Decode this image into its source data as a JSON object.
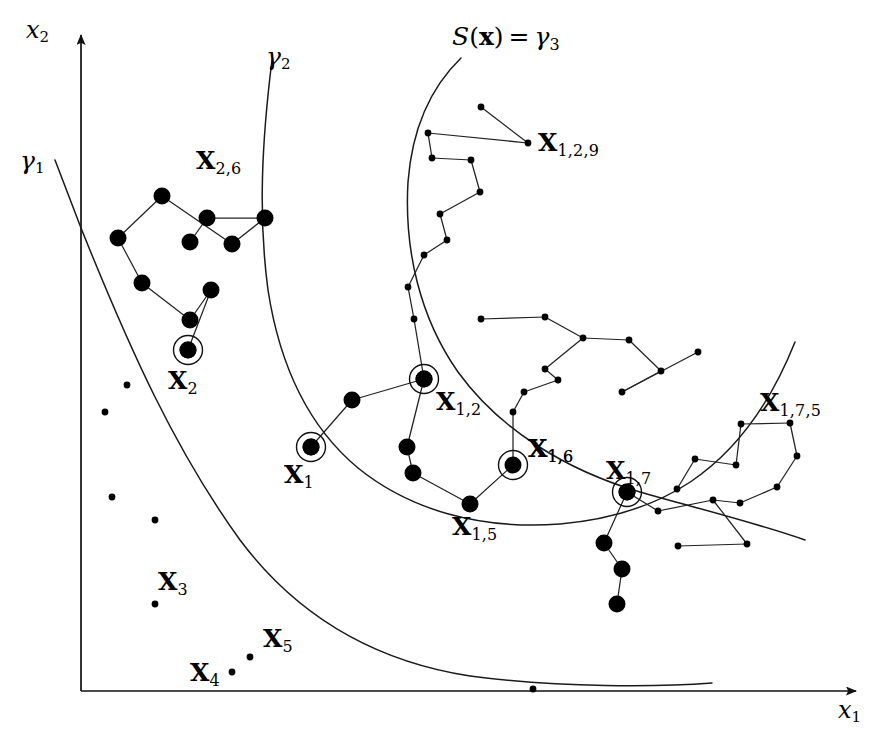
{
  "figure": {
    "kind": "scatter-tree-level-set-diagram",
    "background_color": "#ffffff",
    "ink_color": "#000000",
    "width": 891,
    "height": 746
  },
  "axes": {
    "x_label": "x",
    "x_label_sub": "1",
    "y_label": "x",
    "y_label_sub": "2",
    "x_axis": {
      "x1": 81,
      "y1": 691,
      "x2": 856,
      "y2": 691
    },
    "y_axis": {
      "x1": 81,
      "y1": 691,
      "x2": 81,
      "y2": 35
    }
  },
  "curves": [
    {
      "id": "gamma1",
      "label_base": "γ",
      "label_sub": "1",
      "label_x": 20,
      "label_y": 148,
      "path": "M 55 160 L 81 228 C 130 350 175 450 240 540 C 300 620 380 662 470 676 C 560 688 660 687 712 683"
    },
    {
      "id": "gamma2",
      "label_base": "γ",
      "label_sub": "2",
      "label_x": 266,
      "label_y": 44,
      "path": "M 272 60 C 262 140 258 215 268 290 C 280 368 310 428 358 468 C 410 510 480 530 560 524 C 650 516 740 480 795 342"
    },
    {
      "id": "gamma3",
      "label_sfunc": "S",
      "label_paren_open": "(",
      "label_bf_x": "x",
      "label_paren_close": ")",
      "label_eq": "=",
      "label_gamma": "γ",
      "label_sub": "3",
      "label_x": 452,
      "label_y": 24,
      "path": "M 461 58 C 430 88 412 130 408 182 C 404 250 420 318 458 372 C 500 430 566 470 640 492 C 700 509 760 524 805 540"
    }
  ],
  "curve_notes": {
    "gamma2_tail": "M 795 342 C 760 352 700 366 640 392",
    "gamma2_tail_enabled": false
  },
  "clusters": [
    {
      "id": "cluster-x26",
      "label": "X",
      "label_sub": "2,6",
      "label_x": 196,
      "label_y": 148,
      "marker": "large",
      "nodes": [
        [
          118,
          238
        ],
        [
          142,
          283
        ],
        [
          162,
          196
        ],
        [
          190,
          242
        ],
        [
          207,
          218
        ],
        [
          190,
          320
        ],
        [
          211,
          290
        ],
        [
          232,
          244
        ],
        [
          265,
          218
        ],
        [
          188,
          350
        ]
      ],
      "edges": [
        [
          2,
          0
        ],
        [
          0,
          1
        ],
        [
          1,
          5
        ],
        [
          5,
          6
        ],
        [
          6,
          9
        ],
        [
          9,
          10
        ],
        [
          2,
          7
        ],
        [
          7,
          8
        ],
        [
          8,
          4
        ],
        [
          4,
          3
        ],
        [
          3,
          11
        ]
      ]
    },
    {
      "id": "cluster-x129",
      "label": "X",
      "label_sub": "1,2,9",
      "label_x": 538,
      "label_y": 130,
      "marker": "small",
      "nodes": [
        [
          481,
          107
        ],
        [
          528,
          143
        ],
        [
          428,
          133
        ],
        [
          432,
          158
        ],
        [
          471,
          160
        ],
        [
          480,
          192
        ],
        [
          440,
          214
        ],
        [
          447,
          240
        ],
        [
          424,
          255
        ],
        [
          408,
          287
        ],
        [
          414,
          319
        ]
      ],
      "edges": [
        [
          0,
          1
        ],
        [
          1,
          2
        ],
        [
          2,
          3
        ],
        [
          3,
          4
        ],
        [
          4,
          5
        ],
        [
          5,
          6
        ],
        [
          6,
          7
        ],
        [
          7,
          8
        ],
        [
          8,
          9
        ],
        [
          9,
          10
        ]
      ]
    },
    {
      "id": "cluster-x16-chain",
      "label": "X",
      "label_sub": "1,6",
      "label_x": 528,
      "label_y": 436,
      "marker": "small",
      "nodes": [
        [
          481,
          319
        ],
        [
          545,
          317
        ],
        [
          583,
          338
        ],
        [
          629,
          340
        ],
        [
          661,
          371
        ],
        [
          622,
          392
        ],
        [
          698,
          352
        ],
        [
          545,
          369
        ],
        [
          558,
          380
        ],
        [
          524,
          392
        ],
        [
          513,
          412
        ]
      ],
      "edges": [
        [
          1,
          0
        ],
        [
          1,
          2
        ],
        [
          2,
          3
        ],
        [
          3,
          4
        ],
        [
          4,
          5
        ],
        [
          5,
          6
        ],
        [
          2,
          7
        ],
        [
          7,
          8
        ],
        [
          8,
          9
        ],
        [
          9,
          10
        ]
      ]
    },
    {
      "id": "cluster-x175",
      "label": "X",
      "label_sub": "1,7,5",
      "label_x": 760,
      "label_y": 390,
      "marker": "small",
      "nodes": [
        [
          741,
          424
        ],
        [
          790,
          423
        ],
        [
          797,
          456
        ],
        [
          777,
          487
        ],
        [
          740,
          503
        ],
        [
          713,
          500
        ],
        [
          736,
          465
        ],
        [
          695,
          459
        ],
        [
          677,
          489
        ],
        [
          658,
          511
        ]
      ],
      "edges": [
        [
          0,
          1
        ],
        [
          1,
          2
        ],
        [
          2,
          3
        ],
        [
          3,
          4
        ],
        [
          4,
          5
        ],
        [
          0,
          6
        ],
        [
          6,
          7
        ],
        [
          7,
          8
        ],
        [
          5,
          9
        ]
      ]
    },
    {
      "id": "cluster-x1-chain",
      "label": null,
      "marker": "large",
      "nodes": [
        [
          311,
          447
        ],
        [
          352,
          400
        ],
        [
          424,
          379
        ],
        [
          407,
          447
        ],
        [
          413,
          473
        ],
        [
          470,
          504
        ]
      ],
      "edges": [
        [
          0,
          1
        ],
        [
          1,
          2
        ],
        [
          2,
          3
        ],
        [
          3,
          4
        ],
        [
          4,
          5
        ]
      ]
    },
    {
      "id": "cluster-x17-tail",
      "label": null,
      "marker": "large",
      "nodes": [
        [
          627,
          492
        ],
        [
          604,
          543
        ],
        [
          622,
          569
        ],
        [
          617,
          604
        ]
      ],
      "edges": [
        [
          0,
          1
        ],
        [
          1,
          2
        ],
        [
          2,
          3
        ]
      ]
    },
    {
      "id": "link-x15-x16",
      "label": null,
      "marker": "none",
      "nodes": [
        [
          470,
          504
        ],
        [
          513,
          465
        ]
      ],
      "edges": [
        [
          0,
          1
        ]
      ]
    },
    {
      "id": "link-x16-up",
      "label": null,
      "marker": "none",
      "nodes": [
        [
          513,
          465
        ],
        [
          513,
          412
        ]
      ],
      "edges": [
        [
          0,
          1
        ]
      ]
    },
    {
      "id": "link-x129-x12",
      "label": null,
      "marker": "none",
      "nodes": [
        [
          414,
          319
        ],
        [
          424,
          379
        ]
      ],
      "edges": [
        [
          0,
          1
        ]
      ]
    },
    {
      "id": "link-x17-x175",
      "label": null,
      "marker": "none",
      "nodes": [
        [
          627,
          492
        ],
        [
          658,
          511
        ]
      ],
      "edges": [
        [
          0,
          1
        ]
      ]
    },
    {
      "id": "link-x175-lower",
      "label": null,
      "marker": "small",
      "nodes": [
        [
          678,
          546
        ],
        [
          747,
          544
        ]
      ],
      "edges": [
        [
          0,
          1
        ]
      ]
    },
    {
      "id": "link-x175-lower2",
      "label": null,
      "marker": "none",
      "nodes": [
        [
          747,
          544
        ],
        [
          713,
          500
        ]
      ],
      "edges": [
        [
          0,
          1
        ]
      ]
    }
  ],
  "marked_points": [
    {
      "id": "X1",
      "label": "X",
      "label_sub": "1",
      "x": 311,
      "y": 447,
      "label_x": 284,
      "label_y": 462,
      "marker": "large",
      "ringed": true
    },
    {
      "id": "X2",
      "label": "X",
      "label_sub": "2",
      "x": 188,
      "y": 350,
      "label_x": 168,
      "label_y": 368,
      "marker": "large",
      "ringed": true
    },
    {
      "id": "X12",
      "label": "X",
      "label_sub": "1,2",
      "x": 424,
      "y": 379,
      "label_x": 436,
      "label_y": 389,
      "marker": "large",
      "ringed": true
    },
    {
      "id": "X16",
      "label": "X",
      "label_sub": "1,6",
      "x": 513,
      "y": 465,
      "label_x": 528,
      "label_y": 436,
      "marker": "large",
      "ringed": true
    },
    {
      "id": "X17",
      "label": "X",
      "label_sub": "1,7",
      "x": 627,
      "y": 492,
      "label_x": 606,
      "label_y": 458,
      "marker": "large",
      "ringed": true
    }
  ],
  "plain_labels": [
    {
      "id": "X15",
      "label": "X",
      "label_sub": "1,5",
      "label_x": 452,
      "label_y": 514
    },
    {
      "id": "X3",
      "label": "X",
      "label_sub": "3",
      "label_x": 158,
      "label_y": 569
    },
    {
      "id": "X5",
      "label": "X",
      "label_sub": "5",
      "label_x": 263,
      "label_y": 626
    },
    {
      "id": "X4",
      "label": "X",
      "label_sub": "4",
      "label_x": 190,
      "label_y": 660
    }
  ],
  "isolated_points": [
    {
      "id": "iso-a",
      "x": 127,
      "y": 385,
      "marker": "small"
    },
    {
      "id": "iso-b",
      "x": 105,
      "y": 412,
      "marker": "small"
    },
    {
      "id": "iso-c",
      "x": 112,
      "y": 497,
      "marker": "small"
    },
    {
      "id": "iso-d",
      "x": 155,
      "y": 520,
      "marker": "small"
    },
    {
      "id": "X3-dot",
      "x": 155,
      "y": 604,
      "marker": "small"
    },
    {
      "id": "X5-dot",
      "x": 250,
      "y": 657,
      "marker": "small"
    },
    {
      "id": "X4-dot",
      "x": 232,
      "y": 672,
      "marker": "small"
    },
    {
      "id": "axis-dot",
      "x": 533,
      "y": 689,
      "marker": "small"
    }
  ],
  "marker_sizes": {
    "large_radius": 8.5,
    "small_radius": 3.4,
    "ring_radius": 14.5
  }
}
